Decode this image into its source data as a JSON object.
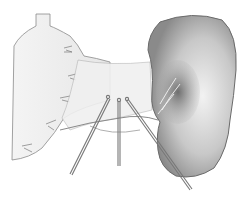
{
  "figure": {
    "type": "surgical-illustration",
    "style": "pencil-drawing",
    "subjects": [
      "stomach",
      "spleen",
      "splenic-hilum-vessels",
      "short-gastric-vessels",
      "surgical-clamps"
    ],
    "instrument_count": 3,
    "colors": {
      "background": "#ffffff",
      "line": "#6a6a6a",
      "shade_dark": "#4a4a4a",
      "shade_mid": "#9a9a9a",
      "shade_light": "#d6d6d6"
    }
  }
}
